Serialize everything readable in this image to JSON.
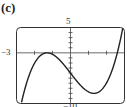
{
  "panel_label": "(c)",
  "chart_data": {
    "type": "line",
    "title": "",
    "xlabel": "",
    "ylabel": "",
    "xlim": [
      -3,
      3
    ],
    "ylim": [
      -10,
      5
    ],
    "x_tick_step": 1,
    "y_tick_step": 1,
    "grid": false,
    "legend": null,
    "tick_labels": {
      "xmin": "−3",
      "ymax": "5",
      "ymin": "−10"
    },
    "series": [
      {
        "name": "cubic",
        "x": [
          -2.7,
          -2.5,
          -2.0,
          -1.5,
          -1.3,
          -1.0,
          -0.5,
          0.0,
          0.5,
          1.0,
          1.3,
          1.5,
          2.0,
          2.5,
          2.6,
          2.85
        ],
        "y": [
          -9.45,
          -7.7,
          -3.5,
          -0.1,
          0.0,
          -0.3,
          -1.8,
          -4.0,
          -6.2,
          -7.7,
          -8.0,
          -7.9,
          -5.9,
          -0.3,
          0.0,
          5.0
        ]
      }
    ],
    "features": {
      "local_max": [
        -1.3,
        0
      ],
      "local_min": [
        1.3,
        -8
      ],
      "y_intercept": -4,
      "x_intercepts": [
        -1.3,
        2.6
      ]
    }
  }
}
